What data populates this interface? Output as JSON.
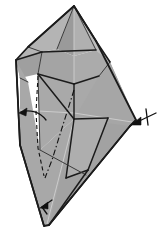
{
  "figure": {
    "kind": "origami-fold-diagram",
    "title": "Origami folding step diagram",
    "canvas": {
      "width": 161,
      "height": 235
    },
    "background_color": "#ffffff"
  },
  "palette": {
    "paper_front": "#a8a8a8",
    "paper_shade_light": "#b4b4b4",
    "paper_shade_lighter": "#bdbdbd",
    "paper_shade_dark": "#9a9a9a",
    "paper_shade_darker": "#8f8f8f",
    "outline": "#1b1b1b",
    "crease_line": "#3a3a3a",
    "soft_crease": "#cfcfcf",
    "arrow": "#111111"
  },
  "shapes": {
    "outer_silhouette": {
      "name": "model-outline",
      "points": "74,6 96,41 136,120 130,126 49,225 44,226 20,145 16,60 28,47"
    },
    "facets": [
      {
        "name": "facet-top-left-flap",
        "points": "74,6 28,47 16,60 42,52 57,49",
        "fill": "#b4b4b4"
      },
      {
        "name": "facet-top-left-inner",
        "points": "74,6 57,49 74,56 74,6",
        "fill": "#9a9a9a"
      },
      {
        "name": "facet-top-right-inner",
        "points": "74,6 74,56 96,50 96,41",
        "fill": "#b0b0b0"
      },
      {
        "name": "facet-top-right-flap",
        "points": "74,6 96,41 110,62 96,50",
        "fill": "#bdbdbd"
      },
      {
        "name": "facet-left-upper-band",
        "points": "16,60 42,52 38,74 20,78",
        "fill": "#9f9f9f"
      },
      {
        "name": "facet-left-body",
        "points": "16,60 20,78 20,145 44,226 40,150 28,82",
        "fill": "#a8a8a8"
      },
      {
        "name": "facet-center-upper-left",
        "points": "42,52 57,49 74,56 74,84 38,74",
        "fill": "#a4a4a4"
      },
      {
        "name": "facet-center-upper-right",
        "points": "74,56 96,50 110,62 99,76 74,84",
        "fill": "#ababab"
      },
      {
        "name": "facet-center-body",
        "points": "38,74 74,84 99,76 110,62 136,120 108,118 74,119 40,150",
        "fill": "#a9a9a9"
      },
      {
        "name": "facet-right-large",
        "points": "110,62 136,120 130,126 88,170 74,119 99,76",
        "fill": "#a6a6a6"
      },
      {
        "name": "facet-lower-left",
        "points": "20,145 40,150 74,119 86,175 49,225 44,226",
        "fill": "#a8a8a8"
      },
      {
        "name": "facet-lower-right-wedge",
        "points": "74,119 130,126 49,225",
        "fill": "#a2a2a2"
      },
      {
        "name": "facet-notch-tab",
        "points": "74,119 108,118 88,170 66,178",
        "fill": "#aeaeae"
      }
    ],
    "creases": [
      {
        "name": "crease-apex-to-left-shoulder",
        "d": "M74,6 L28,47",
        "style": "outline"
      },
      {
        "name": "crease-apex-to-right-shoulder",
        "d": "M74,6 L96,41",
        "style": "outline"
      },
      {
        "name": "crease-apex-center-vertical",
        "d": "M74,6 L74,119",
        "style": "soft"
      },
      {
        "name": "crease-left-inner-ridge",
        "d": "M74,6 L57,49",
        "style": "crease"
      },
      {
        "name": "crease-right-inner-ridge",
        "d": "M74,6 L96,50",
        "style": "crease"
      },
      {
        "name": "crease-horizontal-band",
        "d": "M42,52 L96,50",
        "style": "crease-bold"
      },
      {
        "name": "crease-left-shoulder-to-band",
        "d": "M28,47 L42,52",
        "style": "crease"
      },
      {
        "name": "crease-band-left-drop",
        "d": "M16,60 L42,52",
        "style": "outline"
      },
      {
        "name": "crease-band-right-drop",
        "d": "M96,41 L110,62",
        "style": "outline"
      },
      {
        "name": "crease-left-v-to-center",
        "d": "M38,74 L74,84",
        "style": "crease-bold"
      },
      {
        "name": "crease-center-to-right-v",
        "d": "M74,84 L99,76",
        "style": "crease-bold"
      },
      {
        "name": "crease-left-band-edge",
        "d": "M42,52 L38,74",
        "style": "crease"
      },
      {
        "name": "crease-right-band-edge",
        "d": "M110,62 L99,76",
        "style": "crease"
      },
      {
        "name": "crease-left-outer-drop",
        "d": "M16,60 L20,145",
        "style": "outline"
      },
      {
        "name": "crease-left-inner-drop",
        "d": "M38,74 L40,150",
        "style": "crease"
      },
      {
        "name": "crease-left-fold-spine",
        "d": "M20,78 L28,82",
        "style": "crease"
      },
      {
        "name": "crease-center-diag-down",
        "d": "M74,84 L74,119",
        "style": "crease-bold"
      },
      {
        "name": "crease-center-left-diag",
        "d": "M38,74 L74,119",
        "style": "crease-bold"
      },
      {
        "name": "crease-notch-top",
        "d": "M74,119 L108,118",
        "style": "crease-bold"
      },
      {
        "name": "crease-notch-right-drop",
        "d": "M108,118 L88,170",
        "style": "crease-bold"
      },
      {
        "name": "crease-notch-bottom",
        "d": "M88,170 L66,178",
        "style": "crease-bold"
      },
      {
        "name": "crease-notch-left-rise",
        "d": "M66,178 L74,119",
        "style": "crease-bold"
      },
      {
        "name": "crease-lower-left-long",
        "d": "M40,150 L86,175",
        "style": "crease"
      },
      {
        "name": "crease-lower-to-apex-bottom",
        "d": "M88,170 L49,225",
        "style": "crease-bold"
      },
      {
        "name": "crease-right-long-edge",
        "d": "M130,126 L49,225",
        "style": "outline"
      },
      {
        "name": "crease-left-long-edge",
        "d": "M20,145 L44,226",
        "style": "outline"
      },
      {
        "name": "crease-bottom-center-vertical",
        "d": "M74,119 L47,224",
        "style": "soft"
      },
      {
        "name": "crease-right-tip-cut",
        "d": "M136,120 L130,126",
        "style": "outline"
      },
      {
        "name": "crease-horizon-guide",
        "d": "M74,113 L132,122",
        "style": "soft"
      },
      {
        "name": "crease-left-horizon-guide",
        "d": "M20,110 L74,113",
        "style": "soft"
      }
    ],
    "fold_lines": [
      {
        "name": "valley-fold-dashed",
        "d": "M38,76 L36,112 L38,148 L44,176",
        "type": "dashed",
        "dash": "4,3"
      },
      {
        "name": "mountain-fold-dash-dot",
        "d": "M74,90 L62,128 L52,160 L45,178",
        "type": "dash-dot",
        "dash": "6,2.5,1.5,2.5"
      }
    ],
    "arrows": [
      {
        "name": "fold-arrow-left-curved",
        "label": "curved fold arrow pointing left",
        "path": "M46,120 C40,112 30,109 21,112",
        "head": "19,113 27,108 26,116"
      },
      {
        "name": "fold-arrow-right-pointer",
        "label": "straight arrow pointing down-left at right edge",
        "path": "M156,113 L133,124",
        "head": "131,125 141,117 141,125"
      },
      {
        "name": "fold-arrow-right-tick",
        "label": "tick cross mark on right arrow",
        "path": "M146,109 L148,125"
      },
      {
        "name": "fold-arrow-bottom-small",
        "label": "small arrow near bottom point",
        "path": "M52,200 L42,207",
        "head": "40,208 48,202 48,209"
      },
      {
        "name": "fold-arrow-bottom-tail",
        "label": "tail stroke of bottom arrow",
        "path": "M42,207 L47,214"
      }
    ]
  }
}
